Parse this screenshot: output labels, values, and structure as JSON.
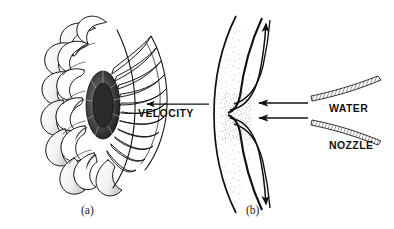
{
  "figure": {
    "background_color": "#ffffff",
    "ink_color": "#111111",
    "width": 394,
    "height": 229
  },
  "panels": [
    {
      "id": "a",
      "caption": "(a)",
      "subject": "pelton-wheel-runner",
      "description": "Perspective line drawing of a Pelton wheel runner with radial cup shaped buckets around a central hub",
      "bucket_count": 22
    },
    {
      "id": "b",
      "caption": "(b)",
      "subject": "bucket-cross-section",
      "description": "Cross section of a single split bucket with water jet entering from the nozzle and deflecting symmetrically"
    }
  ],
  "labels": {
    "velocity": "VELOCITY",
    "water": "WATER",
    "nozzle": "NOZZLE"
  },
  "captions": {
    "a": "(a)",
    "b": "(b)"
  },
  "annotations": {
    "velocity_arrow_direction": "left",
    "jet_arrow_direction": "left",
    "jet_arrow_count": 2,
    "deflection_arrow_count": 2,
    "nozzle_blade_count": 2
  }
}
